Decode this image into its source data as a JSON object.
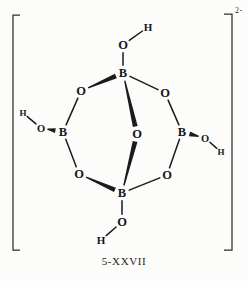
{
  "figure": {
    "caption": "5-XXVII",
    "charge": "2-",
    "ink_color": "#1b1b1b",
    "background_color": "#fcfcfa"
  },
  "molecule": {
    "atoms": [
      {
        "id": "H_top",
        "symbol": "H",
        "x": 148,
        "y": 27,
        "size": 11
      },
      {
        "id": "O_top",
        "symbol": "O",
        "x": 123,
        "y": 45,
        "size": 12.5
      },
      {
        "id": "B_top",
        "symbol": "B",
        "x": 123,
        "y": 73,
        "size": 12.5
      },
      {
        "id": "O_ul",
        "symbol": "O",
        "x": 81,
        "y": 91,
        "size": 12.5
      },
      {
        "id": "O_ur",
        "symbol": "O",
        "x": 165,
        "y": 93,
        "size": 12.5
      },
      {
        "id": "H_left",
        "symbol": "H",
        "x": 23,
        "y": 113,
        "size": 9
      },
      {
        "id": "O_left",
        "symbol": "O",
        "x": 41,
        "y": 128,
        "size": 10.5
      },
      {
        "id": "B_left",
        "symbol": "B",
        "x": 63,
        "y": 132,
        "size": 12.5
      },
      {
        "id": "O_c",
        "symbol": "O",
        "x": 137,
        "y": 134,
        "size": 12.5
      },
      {
        "id": "B_right",
        "symbol": "B",
        "x": 182,
        "y": 132,
        "size": 12.5
      },
      {
        "id": "O_right",
        "symbol": "O",
        "x": 205,
        "y": 138,
        "size": 10.5
      },
      {
        "id": "H_right",
        "symbol": "H",
        "x": 221,
        "y": 152,
        "size": 9
      },
      {
        "id": "O_ll",
        "symbol": "O",
        "x": 79,
        "y": 174,
        "size": 12.5
      },
      {
        "id": "O_lr",
        "symbol": "O",
        "x": 167,
        "y": 175,
        "size": 12.5
      },
      {
        "id": "B_bot",
        "symbol": "B",
        "x": 122,
        "y": 193,
        "size": 12.5
      },
      {
        "id": "O_bot",
        "symbol": "O",
        "x": 122,
        "y": 222,
        "size": 12.5
      },
      {
        "id": "H_bot",
        "symbol": "H",
        "x": 101,
        "y": 240,
        "size": 11
      }
    ],
    "bonds": [
      {
        "from": "O_top",
        "to": "H_top",
        "style": "plain"
      },
      {
        "from": "O_top",
        "to": "B_top",
        "style": "plain"
      },
      {
        "from": "B_top",
        "to": "O_ul",
        "style": "wedge",
        "wide_end": "from"
      },
      {
        "from": "B_top",
        "to": "O_ur",
        "style": "plain"
      },
      {
        "from": "B_top",
        "to": "O_c",
        "style": "wedge",
        "wide_end": "to"
      },
      {
        "from": "O_ul",
        "to": "B_left",
        "style": "plain"
      },
      {
        "from": "O_ur",
        "to": "B_right",
        "style": "plain"
      },
      {
        "from": "H_left",
        "to": "O_left",
        "style": "plain"
      },
      {
        "from": "O_left",
        "to": "B_left",
        "style": "wedge",
        "wide_end": "to"
      },
      {
        "from": "B_left",
        "to": "O_ll",
        "style": "plain"
      },
      {
        "from": "B_right",
        "to": "O_right",
        "style": "wedge",
        "wide_end": "from"
      },
      {
        "from": "O_right",
        "to": "H_right",
        "style": "plain"
      },
      {
        "from": "B_right",
        "to": "O_lr",
        "style": "plain"
      },
      {
        "from": "O_c",
        "to": "B_bot",
        "style": "wedge",
        "wide_end": "from"
      },
      {
        "from": "O_ll",
        "to": "B_bot",
        "style": "wedge",
        "wide_end": "to"
      },
      {
        "from": "O_lr",
        "to": "B_bot",
        "style": "plain"
      },
      {
        "from": "B_bot",
        "to": "O_bot",
        "style": "plain"
      },
      {
        "from": "O_bot",
        "to": "H_bot",
        "style": "plain"
      }
    ]
  },
  "brackets": {
    "left": {
      "x": 13,
      "top": 15,
      "bottom": 250,
      "foot": 7
    },
    "right": {
      "x": 232,
      "top": 14,
      "bottom": 250,
      "foot": 8
    }
  }
}
